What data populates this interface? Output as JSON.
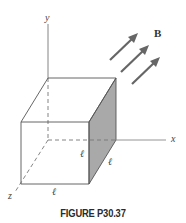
{
  "figure": {
    "caption": "FIGURE P30.37",
    "axes": {
      "x": "x",
      "y": "y",
      "z": "z"
    },
    "field_label": "B",
    "edge_labels": [
      "ℓ",
      "ℓ",
      "ℓ"
    ],
    "colors": {
      "line": "#555555",
      "shaded_face": "#a9a9a9",
      "arrow": "#666666",
      "background": "#ffffff"
    }
  }
}
